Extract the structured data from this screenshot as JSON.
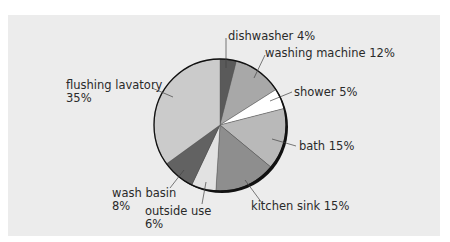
{
  "chart_data": {
    "type": "pie",
    "title": "",
    "start_angle_deg": 0,
    "direction": "clockwise",
    "slices": [
      {
        "label": "dishwasher",
        "value": 4,
        "color": "#5a5a5a"
      },
      {
        "label": "washing machine",
        "value": 12,
        "color": "#a8a8a8"
      },
      {
        "label": "shower",
        "value": 5,
        "color": "#ffffff"
      },
      {
        "label": "bath",
        "value": 15,
        "color": "#b9b9b9"
      },
      {
        "label": "kitchen sink",
        "value": 15,
        "color": "#8e8e8e"
      },
      {
        "label": "outside use",
        "value": 6,
        "color": "#e2e2e2"
      },
      {
        "label": "wash basin",
        "value": 8,
        "color": "#626262"
      },
      {
        "label": "flushing lavatory",
        "value": 35,
        "color": "#cbcbcb"
      }
    ],
    "unit": "%"
  },
  "labels": {
    "dishwasher": "dishwasher 4%",
    "washing_machine": "washing machine 12%",
    "shower": "shower 5%",
    "bath": "bath 15%",
    "kitchen_sink": "kitchen sink 15%",
    "outside_use_1": "outside use",
    "outside_use_2": "6%",
    "wash_basin_1": "wash basin",
    "wash_basin_2": "8%",
    "flushing_lavatory_1": "flushing lavatory",
    "flushing_lavatory_2": "35%"
  }
}
